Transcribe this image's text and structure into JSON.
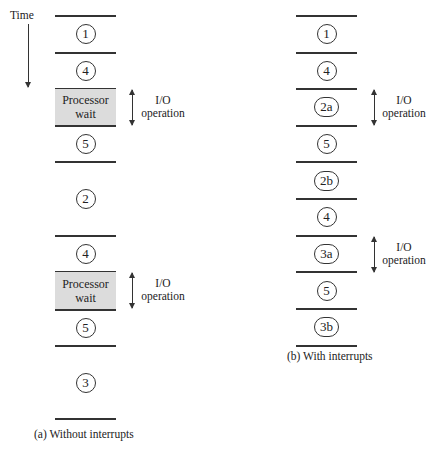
{
  "time_label": "Time",
  "panel_a": {
    "caption": "(a) Without interrupts",
    "segments": [
      {
        "label": "1",
        "type": "step"
      },
      {
        "label": "4",
        "type": "step"
      },
      {
        "label": "Processor",
        "label2": "wait",
        "type": "wait"
      },
      {
        "label": "5",
        "type": "step"
      },
      {
        "label": "2",
        "type": "step"
      },
      {
        "label": "4",
        "type": "step"
      },
      {
        "label": "Processor",
        "label2": "wait",
        "type": "wait"
      },
      {
        "label": "5",
        "type": "step"
      },
      {
        "label": "3",
        "type": "step"
      }
    ],
    "io_labels": [
      {
        "line1": "I/O",
        "line2": "operation"
      },
      {
        "line1": "I/O",
        "line2": "operation"
      }
    ]
  },
  "panel_b": {
    "caption": "(b) With interrupts",
    "segments": [
      {
        "label": "1"
      },
      {
        "label": "4"
      },
      {
        "label": "2a"
      },
      {
        "label": "5"
      },
      {
        "label": "2b"
      },
      {
        "label": "4"
      },
      {
        "label": "3a"
      },
      {
        "label": "5"
      },
      {
        "label": "3b"
      }
    ],
    "io_labels": [
      {
        "line1": "I/O",
        "line2": "operation"
      },
      {
        "line1": "I/O",
        "line2": "operation"
      }
    ]
  }
}
